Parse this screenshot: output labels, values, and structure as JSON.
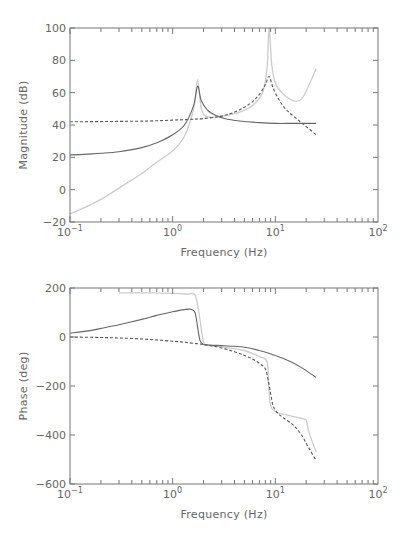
{
  "chart_data": [
    {
      "type": "line",
      "title": "",
      "xlabel": "Frequency (Hz)",
      "ylabel": "Magnitude (dB)",
      "xscale": "log",
      "xlim": [
        0.1,
        100
      ],
      "ylim": [
        -20,
        100
      ],
      "xticks": [
        "10^-1",
        "10^0",
        "10^1",
        "10^2"
      ],
      "yticks": [
        -20,
        0,
        20,
        40,
        60,
        80,
        100
      ],
      "grid": false,
      "legend": null,
      "series": [
        {
          "name": "solid",
          "style": "solid",
          "color": "#666666",
          "x": [
            0.1,
            0.15,
            0.2,
            0.3,
            0.5,
            0.7,
            1.0,
            1.3,
            1.6,
            1.75,
            1.9,
            2.2,
            2.6,
            3.2,
            4.5,
            7,
            10,
            15,
            25
          ],
          "y": [
            21.5,
            22,
            22.5,
            23.5,
            26,
            29,
            34,
            40,
            52,
            64,
            55,
            49,
            46,
            44,
            42.5,
            41.5,
            41,
            41,
            41
          ]
        },
        {
          "name": "dashed",
          "style": "dashed",
          "color": "#555555",
          "x": [
            0.1,
            0.3,
            0.6,
            1.0,
            1.5,
            2,
            3,
            4,
            5,
            6,
            7,
            8,
            8.7,
            9.5,
            11,
            13,
            16,
            20,
            25
          ],
          "y": [
            42,
            42.2,
            42.5,
            43,
            43.5,
            44,
            45.5,
            48,
            51,
            54.5,
            59,
            65,
            70,
            63,
            55,
            49,
            44,
            39,
            34
          ]
        },
        {
          "name": "light",
          "style": "solid",
          "color": "#cccccc",
          "x": [
            0.1,
            0.15,
            0.2,
            0.3,
            0.5,
            0.7,
            1.0,
            1.3,
            1.6,
            1.75,
            1.9,
            2.2,
            3,
            4.5,
            6,
            7.5,
            8.3,
            8.7,
            9.2,
            10,
            12,
            15,
            18,
            21,
            25
          ],
          "y": [
            -15,
            -10,
            -6,
            1,
            10,
            17,
            24,
            33,
            50,
            68,
            50,
            45,
            45.5,
            48,
            52,
            60,
            75,
            100,
            78,
            66,
            59,
            55,
            56,
            64,
            75
          ]
        }
      ]
    },
    {
      "type": "line",
      "title": "",
      "xlabel": "Frequency (Hz)",
      "ylabel": "Phase (deg)",
      "xscale": "log",
      "xlim": [
        0.1,
        100
      ],
      "ylim": [
        -600,
        200
      ],
      "xticks": [
        "10^-1",
        "10^0",
        "10^1",
        "10^2"
      ],
      "yticks": [
        -600,
        -400,
        -200,
        0,
        200
      ],
      "grid": false,
      "legend": null,
      "series": [
        {
          "name": "solid",
          "style": "solid",
          "color": "#666666",
          "x": [
            0.1,
            0.15,
            0.2,
            0.3,
            0.5,
            0.7,
            1.0,
            1.3,
            1.5,
            1.65,
            1.75,
            1.85,
            2.0,
            2.3,
            3,
            4,
            5,
            7,
            10,
            14,
            18,
            25
          ],
          "y": [
            15,
            25,
            35,
            50,
            72,
            88,
            103,
            112,
            113,
            100,
            40,
            -15,
            -30,
            -33,
            -35,
            -38,
            -42,
            -55,
            -75,
            -100,
            -125,
            -165
          ]
        },
        {
          "name": "dashed",
          "style": "dashed",
          "color": "#555555",
          "x": [
            0.1,
            0.2,
            0.3,
            0.5,
            0.8,
            1.2,
            1.7,
            2.2,
            3,
            4,
            5,
            6,
            7,
            8,
            8.5,
            9,
            9.5,
            10.5,
            12,
            15,
            18,
            21,
            25
          ],
          "y": [
            0,
            -2,
            -4,
            -8,
            -14,
            -20,
            -27,
            -33,
            -45,
            -60,
            -75,
            -90,
            -108,
            -130,
            -175,
            -230,
            -280,
            -310,
            -330,
            -360,
            -400,
            -450,
            -505
          ]
        },
        {
          "name": "light",
          "style": "solid",
          "color": "#cccccc",
          "x": [
            0.3,
            0.6,
            1.0,
            1.4,
            1.65,
            1.8,
            2.0,
            2.3,
            3,
            5,
            7,
            8.3,
            8.6,
            9,
            10,
            12,
            15,
            19,
            20,
            21,
            23,
            25
          ],
          "y": [
            180,
            180,
            178,
            175,
            172,
            100,
            -20,
            -35,
            -40,
            -55,
            -80,
            -100,
            -200,
            -280,
            -305,
            -315,
            -325,
            -335,
            -340,
            -380,
            -430,
            -470
          ]
        }
      ]
    }
  ],
  "plots": {
    "magnitude": {
      "ylabel": "Magnitude (dB)",
      "xlabel": "Frequency (Hz)",
      "ytick_labels": [
        "100",
        "80",
        "60",
        "40",
        "20",
        "0",
        "−20"
      ]
    },
    "phase": {
      "ylabel": "Phase (deg)",
      "xlabel": "Frequency (Hz)",
      "ytick_labels": [
        "200",
        "0",
        "−200",
        "−400",
        "−600"
      ]
    }
  }
}
